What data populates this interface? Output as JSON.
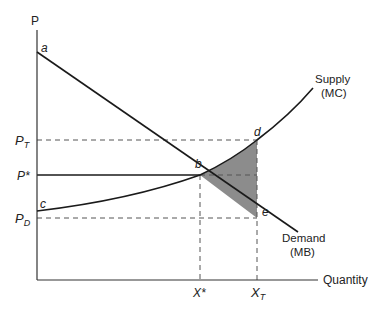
{
  "diagram": {
    "type": "supply-demand-tax-deadweight-loss",
    "axes": {
      "y_label": "P",
      "x_label": "Quantity"
    },
    "price_labels": {
      "p_tax": "P",
      "p_tax_sub": "T",
      "p_star": "P*",
      "p_demand": "P",
      "p_demand_sub": "D"
    },
    "quantity_labels": {
      "x_star": "X*",
      "x_tax": "X",
      "x_tax_sub": "T"
    },
    "points": {
      "a": "a",
      "b": "b",
      "c": "c",
      "d": "d",
      "e": "e"
    },
    "curves": {
      "supply_line1": "Supply",
      "supply_line2": "(MC)",
      "demand_line1": "Demand",
      "demand_line2": "(MB)"
    },
    "colors": {
      "line": "#1a1a1a",
      "dashed": "#555555",
      "shaded_area": "#8c8c8c"
    }
  }
}
